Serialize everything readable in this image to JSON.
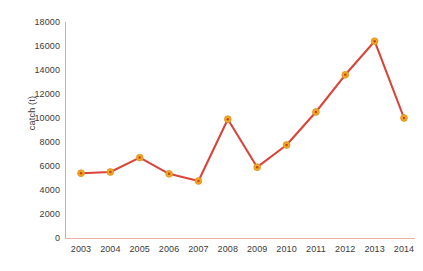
{
  "chart_data": {
    "type": "line",
    "title": "",
    "xlabel": "",
    "ylabel": "catch (t)",
    "categories": [
      "2003",
      "2004",
      "2005",
      "2006",
      "2007",
      "2008",
      "2009",
      "2010",
      "2011",
      "2012",
      "2013",
      "2014"
    ],
    "values": [
      5400,
      5500,
      6700,
      5350,
      4750,
      9900,
      5900,
      7750,
      10500,
      13600,
      16400,
      10000
    ],
    "series": [
      {
        "name": "catch",
        "values": [
          5400,
          5500,
          6700,
          5350,
          4750,
          9900,
          5900,
          7750,
          10500,
          13600,
          16400,
          10000
        ]
      }
    ],
    "ylim": [
      0,
      18000
    ],
    "ytick_labels": [
      "0",
      "2000",
      "4000",
      "6000",
      "8000",
      "10000",
      "12000",
      "14000",
      "16000",
      "18000"
    ],
    "ytick_values": [
      0,
      2000,
      4000,
      6000,
      8000,
      10000,
      12000,
      14000,
      16000,
      18000
    ],
    "grid": false,
    "legend": "none",
    "colors": {
      "line": "#d8453a",
      "marker_fill": "#f0a81e",
      "marker_center": "#c8431f",
      "axis": "#e8a09a",
      "text": "#3b3b3b",
      "background": "#ffffff"
    }
  }
}
